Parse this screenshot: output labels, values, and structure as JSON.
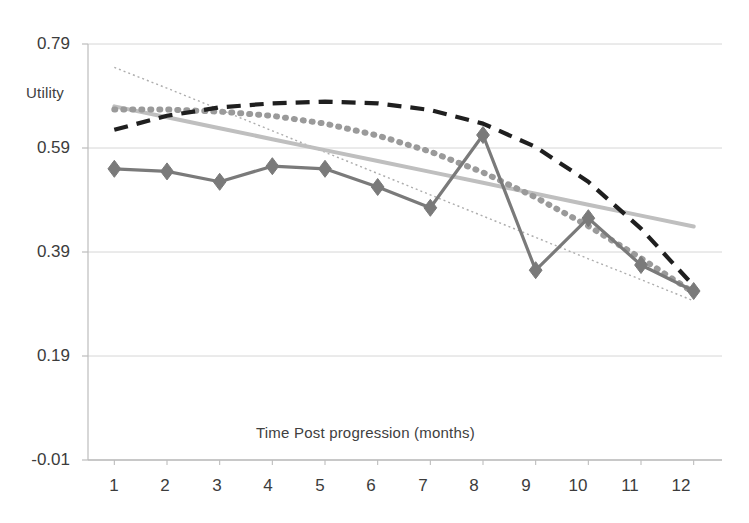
{
  "chart_data": {
    "type": "line",
    "title": "",
    "xlabel": "Time Post progression (months)",
    "ylabel": "Utility",
    "grid": true,
    "legend": "none",
    "xlim": [
      0.5,
      12.5
    ],
    "ylim": [
      -0.01,
      0.79
    ],
    "categories": [
      1,
      2,
      3,
      4,
      5,
      6,
      7,
      8,
      9,
      10,
      11,
      12
    ],
    "xticklabels": [
      "1",
      "2",
      "3",
      "4",
      "5",
      "6",
      "7",
      "8",
      "9",
      "10",
      "11",
      "12"
    ],
    "yticklabels": [
      "-0.01",
      "0.19",
      "0.39",
      "0.59",
      "0.79"
    ],
    "yticks": [
      -0.01,
      0.19,
      0.39,
      0.59,
      0.79
    ],
    "series": [
      {
        "name": "Observed utility",
        "style": "solid-with-diamond-markers",
        "color": "#7a7a7a",
        "marker": "diamond",
        "values": [
          0.55,
          0.545,
          0.525,
          0.555,
          0.55,
          0.515,
          0.475,
          0.615,
          0.355,
          0.455,
          0.365,
          0.315
        ]
      },
      {
        "name": "Polynomial trendline",
        "style": "dashed",
        "color": "#1f1f1f",
        "values": [
          0.625,
          0.652,
          0.668,
          0.676,
          0.679,
          0.676,
          0.663,
          0.637,
          0.592,
          0.525,
          0.435,
          0.325
        ]
      },
      {
        "name": "Dotted trendline",
        "style": "dotted-thick",
        "color": "#9a9a9a",
        "values": [
          0.664,
          0.664,
          0.66,
          0.652,
          0.637,
          0.614,
          0.583,
          0.543,
          0.495,
          0.44,
          0.378,
          0.312
        ]
      },
      {
        "name": "Linear trendline (solid grey)",
        "style": "solid-light",
        "color": "#bfbfbf",
        "values": [
          0.67,
          0.649,
          0.628,
          0.607,
          0.586,
          0.565,
          0.544,
          0.523,
          0.502,
          0.481,
          0.46,
          0.439
        ]
      },
      {
        "name": "Linear trendline (fine dotted)",
        "style": "dotted-thin",
        "color": "#adadad",
        "values": [
          0.745,
          0.705,
          0.664,
          0.623,
          0.582,
          0.541,
          0.5,
          0.459,
          0.418,
          0.377,
          0.337,
          0.296
        ]
      }
    ],
    "colors": {
      "gridline": "#d6d6d6",
      "axis": "#bdbdbd",
      "text": "#3c3c3c",
      "marker_series": "#7a7a7a",
      "dashed_series": "#1f1f1f",
      "dotted_series": "#9a9a9a",
      "light_line": "#bfbfbf",
      "fine_dotted": "#adadad"
    }
  }
}
